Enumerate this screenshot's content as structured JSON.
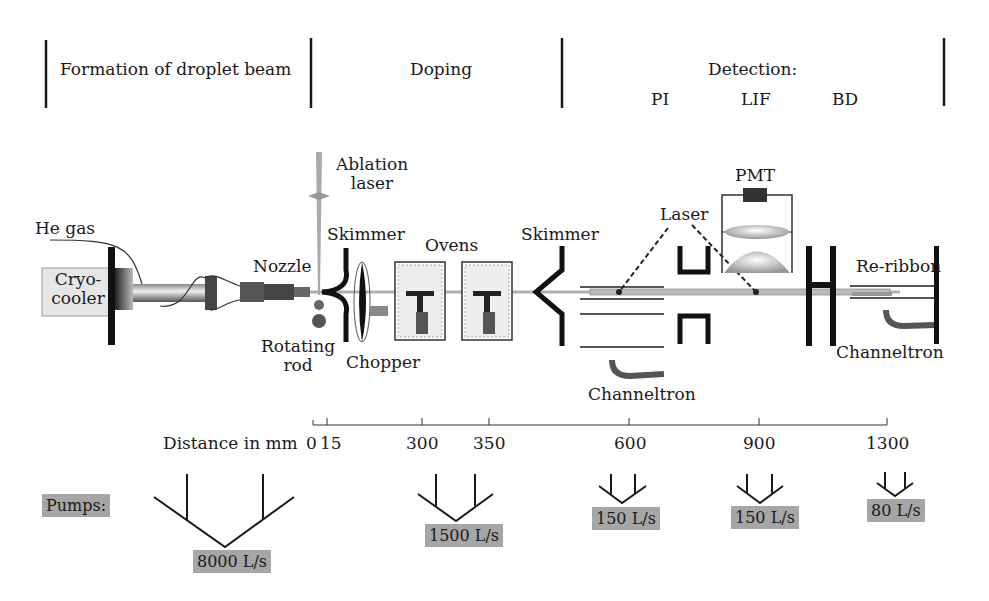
{
  "sections": [
    {
      "label": "Formation of droplet beam"
    },
    {
      "label": "Doping"
    },
    {
      "label": "Detection:",
      "sub": [
        "PI",
        "LIF",
        "BD"
      ]
    }
  ],
  "components": {
    "he_gas": "He gas",
    "cryo_line1": "Cryo-",
    "cryo_line2": "cooler",
    "nozzle": "Nozzle",
    "rotating_line1": "Rotating",
    "rotating_line2": "rod",
    "ablation_line1": "Ablation",
    "ablation_line2": "laser",
    "skimmer1": "Skimmer",
    "chopper": "Chopper",
    "ovens": "Ovens",
    "skimmer2": "Skimmer",
    "laser": "Laser",
    "pmt": "PMT",
    "channeltron1": "Channeltron",
    "re_ribbon": "Re-ribbon",
    "channeltron2": "Channeltron"
  },
  "distance_axis": {
    "label": "Distance in mm",
    "ticks": [
      "0",
      "15",
      "300",
      "350",
      "600",
      "900",
      "1300"
    ]
  },
  "pumps": {
    "label": "Pumps:",
    "speeds": [
      "8000 L/s",
      "1500 L/s",
      "150 L/s",
      "150 L/s",
      "80 L/s"
    ]
  },
  "colors": {
    "line": "#1a1a1a",
    "label_box": "#a6a6a6",
    "cryo_box": "#e6e6e6",
    "beam": "#b0b0b0"
  }
}
